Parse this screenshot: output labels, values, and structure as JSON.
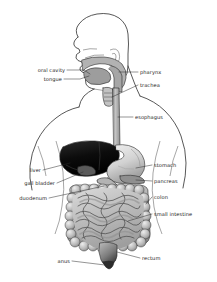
{
  "diagram": {
    "background_color": "#ffffff",
    "outline_color": "#3a3a3a",
    "label_color": "#1b1b1b",
    "leader_color": "#2b2b2b",
    "labels": {
      "oral_cavity": "oral cavity",
      "tongue": "tongue",
      "pharynx": "pharynx",
      "trachea": "trachea",
      "esophagus": "esophagus",
      "liver": "liver",
      "gall_bladder": "gall bladder",
      "duodenum": "duodenum",
      "stomach": "stomach",
      "pancreas": "pancreas",
      "colon": "colon",
      "small_intestine": "small intestine",
      "rectum": "rectum",
      "anus": "anus"
    },
    "organ_colors": {
      "liver": "#111111",
      "stomach": "#d8d8d8",
      "esophagus": "#a8a8a8",
      "colon": "#b9b9b9",
      "small_intestine": "#c9c9c9",
      "pancreas": "#8a8a8a",
      "gall_bladder": "#555555",
      "rectum": "#7d7d7d",
      "oral_cavity": "#b0b0b0",
      "tongue": "#9a9a9a"
    }
  }
}
